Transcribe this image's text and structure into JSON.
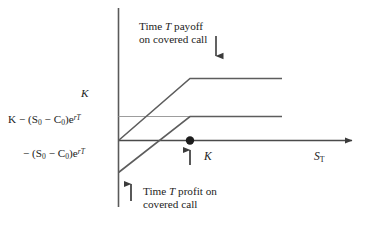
{
  "figure": {
    "background_color": "#ffffff",
    "line_color": "#555555",
    "axis_color": "#444444",
    "text_color": "#222222"
  },
  "axes": {
    "x_axis_name": "S_T",
    "y_axis_name": "",
    "x_axis_label_html": "S<sub>T</sub>",
    "x_tick_label": "K",
    "y_tick_label_top": "K",
    "y_tick_label_mid_html": "K &minus; (S<sub>0</sub> &minus; C<sub>0</sub>)e<sup>rT</sup>",
    "y_tick_label_low_html": "&minus; (S<sub>0</sub> &minus; C<sub>0</sub>)e<sup>rT</sup>",
    "y_tick_label_mid_text": "K - (S0 - C0)e^{rT}",
    "y_tick_label_low_text": "- (S0 - C0)e^{rT}"
  },
  "annotations": {
    "payoff": {
      "line1_html": "Time <i>T</i> payoff",
      "line2_html": "on covered call",
      "line1_text": "Time T payoff",
      "line2_text": "on covered call",
      "arrow": "down-arrow"
    },
    "profit": {
      "line1_html": "Time <i>T</i> profit on",
      "line2_html": "covered call",
      "line1_text": "Time T profit on",
      "line2_text": "covered call",
      "arrow": "up-arrow"
    },
    "strike_marker": {
      "label": "K",
      "arrow": "up-arrow",
      "dot": "filled-circle"
    }
  },
  "chart_data": {
    "type": "line",
    "xlabel": "S_T",
    "ylabel": "",
    "xlim": [
      0,
      100
    ],
    "ylim": [
      -30,
      55
    ],
    "grid": false,
    "legend": "none",
    "series": [
      {
        "name": "Time T payoff on covered call",
        "comment": "min(S_T, K): rises at 45 degrees from origin until S_T = K, then flat at K",
        "x": [
          0,
          38,
          85
        ],
        "y": [
          0,
          38,
          38
        ]
      },
      {
        "name": "Time T profit on covered call",
        "comment": "min(S_T, K) - (S0 - C0)e^{rT}: payoff shifted down by (S0 - C0)e^{rT}",
        "x": [
          0,
          38,
          85
        ],
        "y": [
          -19,
          19,
          19
        ]
      }
    ],
    "reference_lines": [
      {
        "name": "horizontal line at K - (S0 - C0)e^{rT}",
        "y": 19,
        "style": "thin-gray"
      }
    ],
    "markers": [
      {
        "name": "strike-on-x-axis",
        "x": 38,
        "y": 0,
        "label": "K",
        "style": "filled-dot"
      }
    ],
    "y_annotations": [
      {
        "value": 38,
        "label": "K"
      },
      {
        "value": 0,
        "label": "K - (S0 - C0)e^{rT}"
      },
      {
        "value": -19,
        "label": "- (S0 - C0)e^{rT}"
      }
    ]
  }
}
